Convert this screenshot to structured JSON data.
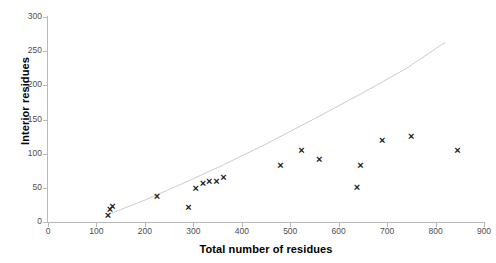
{
  "chart_data": {
    "type": "scatter",
    "title": "",
    "xlabel": "Total number of residues",
    "ylabel": "Interior residues",
    "xlim": [
      0,
      900
    ],
    "ylim": [
      0,
      300
    ],
    "xticks": [
      0,
      100,
      200,
      300,
      400,
      500,
      600,
      700,
      800,
      900
    ],
    "yticks": [
      0,
      50,
      100,
      150,
      200,
      250,
      300
    ],
    "grid": false,
    "legend": null,
    "marker": "x",
    "marker_color": "#1a1a1a",
    "points": [
      {
        "x": 124,
        "y": 10
      },
      {
        "x": 128,
        "y": 18
      },
      {
        "x": 133,
        "y": 22
      },
      {
        "x": 225,
        "y": 37
      },
      {
        "x": 290,
        "y": 21
      },
      {
        "x": 305,
        "y": 49
      },
      {
        "x": 320,
        "y": 57
      },
      {
        "x": 333,
        "y": 60
      },
      {
        "x": 348,
        "y": 60
      },
      {
        "x": 362,
        "y": 65
      },
      {
        "x": 480,
        "y": 82
      },
      {
        "x": 523,
        "y": 105
      },
      {
        "x": 560,
        "y": 91
      },
      {
        "x": 638,
        "y": 50
      },
      {
        "x": 645,
        "y": 82
      },
      {
        "x": 690,
        "y": 120
      },
      {
        "x": 750,
        "y": 125
      },
      {
        "x": 845,
        "y": 104
      }
    ],
    "trend_line": {
      "color": "#cccccc",
      "style": "solid",
      "points": [
        {
          "x": 128,
          "y": 12
        },
        {
          "x": 200,
          "y": 32
        },
        {
          "x": 280,
          "y": 57
        },
        {
          "x": 360,
          "y": 83
        },
        {
          "x": 450,
          "y": 114
        },
        {
          "x": 550,
          "y": 151
        },
        {
          "x": 650,
          "y": 189
        },
        {
          "x": 740,
          "y": 225
        },
        {
          "x": 820,
          "y": 263
        }
      ]
    }
  }
}
